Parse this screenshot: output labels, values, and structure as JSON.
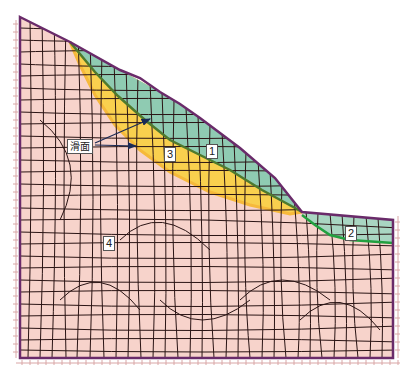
{
  "figure": {
    "colors": {
      "background": "#ffffff",
      "layer4_fill": "#f7d3cb",
      "layer3_fill": "#f9d04e",
      "layer3_edge": "#f6b93b",
      "layer1_fill": "#8fcbb2",
      "layer2_fill": "#a9d6c2",
      "mesh_line": "#2a1414",
      "boundary": "#6a2b6a",
      "layer_interface": "#4e7a2e",
      "interface_bright": "#22a040",
      "support_marks": "#d9a6a6",
      "arrow": "#1a2a55"
    }
  },
  "labels": {
    "layer1": "1",
    "layer2": "2",
    "layer3": "3",
    "layer4": "4",
    "sliding_surface": "滑面"
  },
  "regions": [
    {
      "id": "1",
      "description": "Upper slope surface layer (green)"
    },
    {
      "id": "2",
      "description": "Right crest surface layer (green)"
    },
    {
      "id": "3",
      "description": "Sliding zone band (yellow)"
    },
    {
      "id": "4",
      "description": "Bedrock / base soil (pink)"
    }
  ],
  "annotations": [
    {
      "text": "滑面",
      "meaning": "sliding surface",
      "arrows": 2
    }
  ]
}
